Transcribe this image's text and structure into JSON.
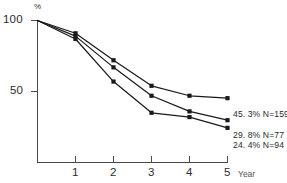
{
  "chart_data": {
    "type": "line",
    "title": "",
    "subtitle": "",
    "xlabel": "Year",
    "ylabel": "%",
    "x": [
      0,
      1,
      2,
      3,
      4,
      5
    ],
    "xlim": [
      0,
      5
    ],
    "ylim": [
      0,
      100
    ],
    "xticks": [
      "1",
      "2",
      "3",
      "4",
      "5"
    ],
    "xtick_values": [
      1,
      2,
      3,
      4,
      5
    ],
    "yticks": [
      "100",
      "50"
    ],
    "ytick_values": [
      100,
      50
    ],
    "grid": false,
    "legend_position": "right-inline",
    "marker": "square",
    "series": [
      {
        "name": "45.3% N=159",
        "percent": "45.3%",
        "n_label": "N=159",
        "n": 159,
        "final_percent": 45.3,
        "values": [
          100,
          91,
          72,
          54,
          47,
          45.3
        ],
        "end_label": "45. 3%  N=159"
      },
      {
        "name": "29.8% N=77",
        "percent": "29.8%",
        "n_label": "N=77",
        "n": 77,
        "final_percent": 29.8,
        "values": [
          100,
          89,
          67,
          47,
          36,
          29.8
        ],
        "end_label": "29. 8%  N=77"
      },
      {
        "name": "24.4% N=94",
        "percent": "24.4%",
        "n_label": "N=94",
        "n": 94,
        "final_percent": 24.4,
        "values": [
          100,
          87,
          57,
          35,
          32,
          24.4
        ],
        "end_label": "24. 4%  N=94"
      }
    ],
    "annotations": [
      "45. 3%  N=159",
      "29. 8%  N=77",
      "24. 4%  N=94"
    ],
    "colors": {
      "line": "#1a1a1a",
      "axis": "#4a4a4a",
      "text": "#2b2b2b"
    }
  },
  "axes": {
    "y_top_label": "100",
    "y_mid_label": "50",
    "y_unit_symbol": "%",
    "x_axis_name": "Year",
    "x_labels": [
      "1",
      "2",
      "3",
      "4",
      "5"
    ]
  }
}
